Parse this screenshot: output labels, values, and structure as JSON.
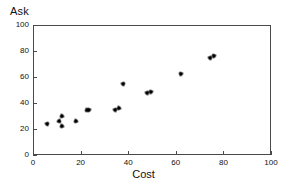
{
  "chart_data": {
    "type": "scatter",
    "title": "",
    "xlabel": "Cost",
    "ylabel": "Ask",
    "xlim": [
      0,
      100
    ],
    "ylim": [
      0,
      100
    ],
    "xticks": [
      0,
      20,
      40,
      60,
      80,
      100
    ],
    "yticks": [
      0,
      20,
      40,
      60,
      80,
      100
    ],
    "xtick_labels": [
      "0",
      "20",
      "40",
      "60",
      "80",
      "100"
    ],
    "ytick_labels": [
      "0",
      "20",
      "40",
      "60",
      "80",
      "100"
    ],
    "grid": false,
    "legend": null,
    "marker": "star",
    "marker_color": "#000000",
    "series": [
      {
        "name": "Ask vs Cost",
        "points": [
          {
            "x": 6,
            "y": 24
          },
          {
            "x": 11,
            "y": 26
          },
          {
            "x": 12,
            "y": 30
          },
          {
            "x": 12,
            "y": 22
          },
          {
            "x": 18,
            "y": 26
          },
          {
            "x": 22.5,
            "y": 34.5
          },
          {
            "x": 23.5,
            "y": 35
          },
          {
            "x": 34.5,
            "y": 35
          },
          {
            "x": 36,
            "y": 36
          },
          {
            "x": 38,
            "y": 55
          },
          {
            "x": 48,
            "y": 48
          },
          {
            "x": 49.5,
            "y": 48.5
          },
          {
            "x": 62,
            "y": 62.5
          },
          {
            "x": 74.5,
            "y": 75
          },
          {
            "x": 76,
            "y": 76.5
          }
        ]
      }
    ]
  }
}
